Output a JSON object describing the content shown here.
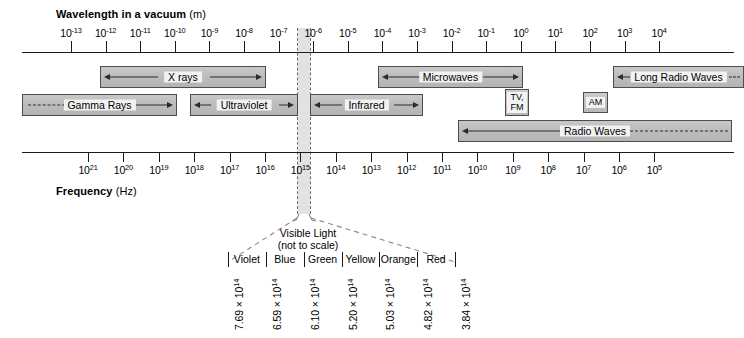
{
  "figure": {
    "top_axis_title_strong": "Wavelength in a vacuum",
    "top_axis_title_unit": "(m)",
    "bottom_axis_title_strong": "Frequency",
    "bottom_axis_title_unit": "(Hz)"
  },
  "chart_data": {
    "type": "diagram",
    "wavelength_axis": {
      "label": "Wavelength in a vacuum (m)",
      "unit": "m",
      "exponents": [
        -13,
        -12,
        -11,
        -10,
        -9,
        -8,
        -7,
        -6,
        -5,
        -4,
        -3,
        -2,
        -1,
        0,
        1,
        2,
        3,
        4
      ],
      "tick_labels": [
        "10-13",
        "10-12",
        "10-11",
        "10-10",
        "10-9",
        "10-8",
        "10-7",
        "10-6",
        "10-5",
        "10-4",
        "10-3",
        "10-2",
        "10-1",
        "100",
        "101",
        "102",
        "103",
        "104"
      ]
    },
    "frequency_axis": {
      "label": "Frequency (Hz)",
      "unit": "Hz",
      "exponents": [
        21,
        20,
        19,
        18,
        17,
        16,
        15,
        14,
        13,
        12,
        11,
        10,
        9,
        8,
        7,
        6,
        5
      ],
      "tick_labels": [
        "1021",
        "1020",
        "1019",
        "1018",
        "1017",
        "1016",
        "1015",
        "1014",
        "1013",
        "1012",
        "1011",
        "1010",
        "109",
        "108",
        "107",
        "106",
        "105"
      ]
    },
    "bands": [
      {
        "name": "X rays",
        "row": 0,
        "x": 100,
        "width": 166,
        "open_left": false,
        "open_right": false,
        "arrow_left": true,
        "arrow_right": true
      },
      {
        "name": "Microwaves",
        "row": 0,
        "x": 378,
        "width": 145,
        "open_left": false,
        "open_right": false,
        "arrow_left": true,
        "arrow_right": true
      },
      {
        "name": "Long Radio Waves",
        "row": 0,
        "x": 613,
        "width": 131,
        "open_left": false,
        "open_right": true,
        "arrow_left": true,
        "arrow_right": false
      },
      {
        "name": "Gamma Rays",
        "row": 1,
        "x": 22,
        "width": 155,
        "open_left": true,
        "open_right": false,
        "arrow_left": false,
        "arrow_right": true
      },
      {
        "name": "Ultraviolet",
        "row": 1,
        "x": 190,
        "width": 108,
        "open_left": false,
        "open_right": false,
        "arrow_left": true,
        "arrow_right": true
      },
      {
        "name": "Infrared",
        "row": 1,
        "x": 310,
        "width": 113,
        "open_left": false,
        "open_right": false,
        "arrow_left": true,
        "arrow_right": true
      },
      {
        "name": "Radio Waves",
        "row": 2,
        "x": 458,
        "width": 274,
        "open_left": false,
        "open_right": true,
        "arrow_left": true,
        "arrow_right": false
      }
    ],
    "chips": [
      {
        "name": "TV, FM",
        "label": "TV,\nFM",
        "x": 505,
        "y": 89,
        "width": 24,
        "height": 27
      },
      {
        "name": "AM",
        "label": "AM",
        "x": 583,
        "y": 92,
        "width": 25,
        "height": 21
      }
    ],
    "visible_light": {
      "title": "Visible Light\n(not to scale)",
      "colors": [
        "Violet",
        "Blue",
        "Green",
        "Yellow",
        "Orange",
        "Red"
      ],
      "boundary_frequencies": [
        "7.69",
        "6.59",
        "6.10",
        "5.20",
        "5.03",
        "4.82",
        "3.84"
      ],
      "frequency_exponent": "14",
      "frequency_unit": "Hz",
      "boundary_labels": [
        "7.69 × 1014",
        "6.59 × 1014",
        "6.10 × 1014",
        "5.20 × 1014",
        "5.03 × 1014",
        "4.82 × 1014",
        "3.84 × 1014"
      ]
    },
    "colors": {
      "band_fill": "#bfbfbf",
      "band_border": "#4d4d4d",
      "axis": "#1a1a1a",
      "highlight_strip": "#e2e2e2",
      "background": "#ffffff"
    }
  }
}
